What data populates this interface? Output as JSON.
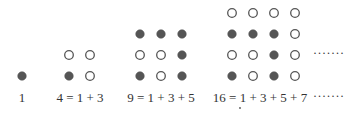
{
  "colors": {
    "filled": "#555555",
    "stroke": "#555555",
    "hollow": "#ffffff",
    "text": "#333333"
  },
  "figures": [
    {
      "label": "1",
      "grid": [
        [
          "f"
        ]
      ]
    },
    {
      "label": "4 = 1 + 3",
      "grid": [
        [
          "o",
          "o"
        ],
        [
          "f",
          "o"
        ]
      ]
    },
    {
      "label": "9 = 1 + 3 + 5",
      "grid": [
        [
          "f",
          "f",
          "f"
        ],
        [
          "o",
          "o",
          "f"
        ],
        [
          "f",
          "o",
          "f"
        ]
      ]
    },
    {
      "label": "16 = 1 + 3 + 5 + 7",
      "grid": [
        [
          "o",
          "o",
          "o",
          "o"
        ],
        [
          "f",
          "f",
          "f",
          "o"
        ],
        [
          "o",
          "o",
          "f",
          "o"
        ],
        [
          "f",
          "o",
          "f",
          "o"
        ]
      ]
    }
  ],
  "continuation_dots": "·······",
  "label_continuation": "·······"
}
